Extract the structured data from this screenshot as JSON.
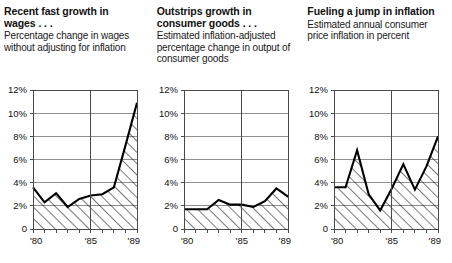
{
  "panels": [
    {
      "id": "wages",
      "title": "Recent fast growth in wages . . .",
      "subtitle": "Percentage change in wages without adjusting for inflation",
      "chart_data": {
        "type": "area",
        "title": "Recent fast growth in wages . . .",
        "subtitle": "Percentage change in wages without adjusting for inflation",
        "xlabel": "",
        "ylabel": "percent",
        "ylim": [
          0,
          12
        ],
        "xlim": [
          1980,
          1989
        ],
        "yticks": [
          0,
          2,
          4,
          6,
          8,
          10,
          12
        ],
        "ytick_labels": [
          "0",
          "2%",
          "4%",
          "6%",
          "8%",
          "10%",
          "12%"
        ],
        "xticks": [
          1980,
          1985,
          1989
        ],
        "xtick_labels": [
          "'80",
          "'85",
          "'89"
        ],
        "grid": true,
        "legend": "none",
        "x": [
          1980,
          1981,
          1982,
          1983,
          1984,
          1985,
          1986,
          1987,
          1988,
          1989
        ],
        "values": [
          3.6,
          2.3,
          3.1,
          1.9,
          2.6,
          2.9,
          3.0,
          3.6,
          7.2,
          10.9
        ]
      }
    },
    {
      "id": "consumer-goods",
      "title": "Outstrips growth in consumer goods . . .",
      "subtitle": "Estimated inflation-adjusted percentage change in output of consumer goods",
      "chart_data": {
        "type": "area",
        "title": "Outstrips growth in consumer goods . . .",
        "subtitle": "Estimated inflation-adjusted percentage change in output of consumer goods",
        "xlabel": "",
        "ylabel": "percent",
        "ylim": [
          0,
          12
        ],
        "xlim": [
          1980,
          1989
        ],
        "yticks": [
          0,
          2,
          4,
          6,
          8,
          10,
          12
        ],
        "ytick_labels": [
          "0",
          "2%",
          "4%",
          "6%",
          "8%",
          "10%",
          "12%"
        ],
        "xticks": [
          1980,
          1985,
          1989
        ],
        "xtick_labels": [
          "'80",
          "'85",
          "'89"
        ],
        "grid": true,
        "legend": "none",
        "x": [
          1980,
          1981,
          1982,
          1983,
          1984,
          1985,
          1986,
          1987,
          1988,
          1989
        ],
        "values": [
          1.7,
          1.7,
          1.7,
          2.5,
          2.1,
          2.1,
          1.9,
          2.4,
          3.5,
          2.8
        ]
      }
    },
    {
      "id": "inflation",
      "title": "Fueling a jump in inflation",
      "subtitle": "Estimated annual consumer price inflation in percent",
      "chart_data": {
        "type": "area",
        "title": "Fueling a jump in inflation",
        "subtitle": "Estimated annual consumer price inflation in percent",
        "xlabel": "",
        "ylabel": "percent",
        "ylim": [
          0,
          12
        ],
        "xlim": [
          1980,
          1989
        ],
        "yticks": [
          0,
          2,
          4,
          6,
          8,
          10,
          12
        ],
        "ytick_labels": [
          "0",
          "2%",
          "4%",
          "6%",
          "8%",
          "10%",
          "12%"
        ],
        "xticks": [
          1980,
          1985,
          1989
        ],
        "xtick_labels": [
          "'80",
          "'85",
          "'89"
        ],
        "grid": true,
        "legend": "none",
        "x": [
          1980,
          1981,
          1982,
          1983,
          1984,
          1985,
          1986,
          1987,
          1988,
          1989
        ],
        "values": [
          3.6,
          3.6,
          6.8,
          3.0,
          1.6,
          3.5,
          5.6,
          3.4,
          5.4,
          8.0
        ]
      }
    }
  ]
}
